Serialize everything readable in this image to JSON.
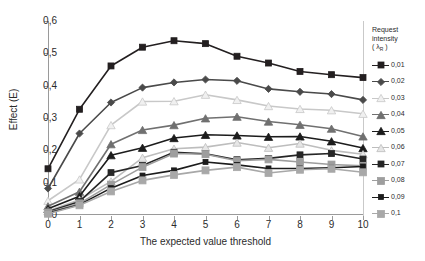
{
  "chart_data": {
    "type": "line",
    "title": "",
    "xlabel": "The expected value threshold",
    "ylabel": "Effect (E)",
    "xlim": [
      0,
      10
    ],
    "ylim": [
      0,
      0.6
    ],
    "grid": true,
    "legend_position": "right",
    "legend_title_line1": "Request",
    "legend_title_line2": "intensity",
    "legend_title_line3_pre": "( λ",
    "legend_title_line3_sub": "R",
    "legend_title_line3_post": " )",
    "x": [
      0,
      1,
      2,
      3,
      4,
      5,
      6,
      7,
      8,
      9,
      10
    ],
    "xticklabels": [
      "0",
      "1",
      "2",
      "3",
      "4",
      "5",
      "6",
      "7",
      "8",
      "9",
      "10"
    ],
    "yticklabels": [
      "0",
      "0,1",
      "0,2",
      "0,3",
      "0,4",
      "0,5",
      "0,6"
    ],
    "ytickvalues": [
      0,
      0.1,
      0.2,
      0.3,
      0.4,
      0.5,
      0.6
    ],
    "series": [
      {
        "name": "0,01",
        "label": "0,01",
        "color": "#231f20",
        "marker": "square",
        "marker_fill": "#231f20",
        "marker_size": 6,
        "values": [
          0.143,
          0.327,
          0.461,
          0.519,
          0.539,
          0.53,
          0.491,
          0.47,
          0.444,
          0.434,
          0.425
        ]
      },
      {
        "name": "0,02",
        "label": "0,02",
        "color": "#4a4a4a",
        "marker": "diamond",
        "marker_fill": "#4a4a4a",
        "marker_size": 6,
        "values": [
          0.082,
          0.252,
          0.348,
          0.394,
          0.41,
          0.419,
          0.415,
          0.39,
          0.381,
          0.374,
          0.356
        ]
      },
      {
        "name": "0,03",
        "label": "0,03",
        "color": "#c8c8c8",
        "marker": "triangle",
        "marker_fill": "#f0f0f0",
        "marker_size": 7,
        "values": [
          0.044,
          0.11,
          0.278,
          0.351,
          0.352,
          0.372,
          0.356,
          0.337,
          0.328,
          0.324,
          0.313
        ]
      },
      {
        "name": "0,04",
        "label": "0,04",
        "color": "#707070",
        "marker": "triangle",
        "marker_fill": "#707070",
        "marker_size": 7,
        "values": [
          0.027,
          0.072,
          0.219,
          0.263,
          0.278,
          0.299,
          0.304,
          0.289,
          0.279,
          0.267,
          0.243
        ]
      },
      {
        "name": "0,05",
        "label": "0,05",
        "color": "#1c1c1c",
        "marker": "triangle",
        "marker_fill": "#1c1c1c",
        "marker_size": 7,
        "values": [
          0.019,
          0.058,
          0.185,
          0.208,
          0.238,
          0.248,
          0.246,
          0.242,
          0.243,
          0.228,
          0.207
        ]
      },
      {
        "name": "0,06",
        "label": "0,06",
        "color": "#bdbdbd",
        "marker": "triangle",
        "marker_fill": "#e6e6e6",
        "marker_size": 7,
        "values": [
          0.012,
          0.047,
          0.104,
          0.177,
          0.205,
          0.21,
          0.224,
          0.208,
          0.221,
          0.2,
          0.188
        ]
      },
      {
        "name": "0,07",
        "label": "0,07",
        "color": "#262626",
        "marker": "square",
        "marker_fill": "#262626",
        "marker_size": 6,
        "values": [
          0.01,
          0.042,
          0.131,
          0.153,
          0.194,
          0.189,
          0.171,
          0.175,
          0.186,
          0.19,
          0.173
        ]
      },
      {
        "name": "0,08",
        "label": "0,08",
        "color": "#9e9e9e",
        "marker": "square",
        "marker_fill": "#9e9e9e",
        "marker_size": 7,
        "values": [
          0.008,
          0.036,
          0.094,
          0.148,
          0.19,
          0.188,
          0.168,
          0.172,
          0.164,
          0.156,
          0.152
        ]
      },
      {
        "name": "0,09",
        "label": "0,09",
        "color": "#1c1c1c",
        "marker": "square",
        "marker_fill": "#1c1c1c",
        "marker_size": 5,
        "values": [
          0.006,
          0.032,
          0.083,
          0.122,
          0.138,
          0.164,
          0.155,
          0.144,
          0.144,
          0.146,
          0.15
        ]
      },
      {
        "name": "0,1",
        "label": "0,1",
        "color": "#a8a8a8",
        "marker": "square",
        "marker_fill": "#a8a8a8",
        "marker_size": 7,
        "values": [
          0.004,
          0.03,
          0.073,
          0.107,
          0.124,
          0.138,
          0.148,
          0.13,
          0.14,
          0.143,
          0.132
        ]
      }
    ]
  }
}
